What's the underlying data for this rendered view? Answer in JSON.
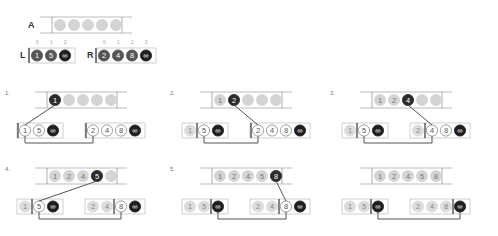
{
  "title_labels": {
    "array": "A",
    "left": "L",
    "right": "R"
  },
  "colors": {
    "empty": "#d4d4d4",
    "filled": "#d9d9d9",
    "active": "#2b2b2b",
    "outline": "#ffffff",
    "line": "#555555",
    "box": "#999999"
  },
  "initial": {
    "array": [
      "",
      "",
      "",
      "",
      ""
    ],
    "left": {
      "indices": [
        "0",
        "1",
        "2"
      ],
      "values": [
        "1",
        "5",
        "∞"
      ]
    },
    "right": {
      "indices": [
        "0",
        "1",
        "2",
        "3"
      ],
      "values": [
        "2",
        "4",
        "8",
        "∞"
      ]
    }
  },
  "steps": [
    {
      "label": "1.",
      "array": [
        "1",
        "",
        "",
        "",
        ""
      ],
      "active_index": 0,
      "left": {
        "values": [
          "1",
          "5",
          "∞"
        ],
        "pointer": 0
      },
      "right": {
        "values": [
          "2",
          "4",
          "8",
          "∞"
        ],
        "pointer": 0
      },
      "chosen": "left"
    },
    {
      "label": "2.",
      "array": [
        "1",
        "2",
        "",
        "",
        ""
      ],
      "active_index": 1,
      "left": {
        "values": [
          "1",
          "5",
          "∞"
        ],
        "pointer": 1
      },
      "right": {
        "values": [
          "2",
          "4",
          "8",
          "∞"
        ],
        "pointer": 0
      },
      "chosen": "right"
    },
    {
      "label": "3.",
      "array": [
        "1",
        "2",
        "4",
        "",
        ""
      ],
      "active_index": 2,
      "left": {
        "values": [
          "1",
          "5",
          "∞"
        ],
        "pointer": 1
      },
      "right": {
        "values": [
          "2",
          "4",
          "8",
          "∞"
        ],
        "pointer": 1
      },
      "chosen": "right"
    },
    {
      "label": "4.",
      "array": [
        "1",
        "2",
        "4",
        "5",
        ""
      ],
      "active_index": 3,
      "left": {
        "values": [
          "1",
          "5",
          "∞"
        ],
        "pointer": 1
      },
      "right": {
        "values": [
          "2",
          "4",
          "8",
          "∞"
        ],
        "pointer": 2
      },
      "chosen": "left"
    },
    {
      "label": "5.",
      "array": [
        "1",
        "2",
        "4",
        "5",
        "8"
      ],
      "active_index": 4,
      "left": {
        "values": [
          "1",
          "5",
          "∞"
        ],
        "pointer": 2
      },
      "right": {
        "values": [
          "2",
          "4",
          "8",
          "∞"
        ],
        "pointer": 2
      },
      "chosen": "right"
    },
    {
      "label": "",
      "array": [
        "1",
        "2",
        "4",
        "5",
        "8"
      ],
      "active_index": -1,
      "left": {
        "values": [
          "1",
          "5",
          "∞"
        ],
        "pointer": 2
      },
      "right": {
        "values": [
          "2",
          "4",
          "8",
          "∞"
        ],
        "pointer": 3
      },
      "chosen": "none"
    }
  ]
}
